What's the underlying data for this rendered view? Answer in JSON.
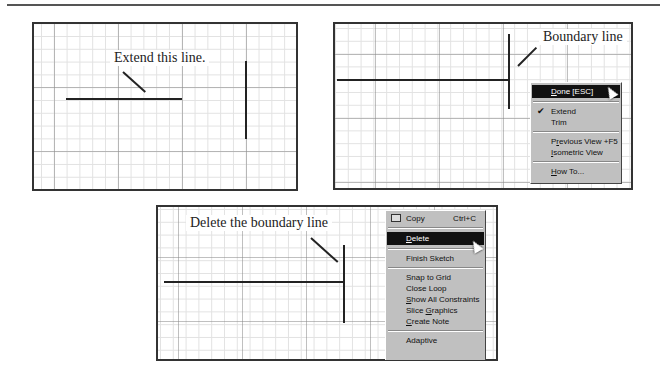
{
  "figures": [
    {
      "id": "extend-step",
      "callout": "Extend this line."
    },
    {
      "id": "boundary-step",
      "callout": "Boundary line",
      "context_menu": {
        "items": [
          {
            "label": "Done [ESC]",
            "mnemonic": "D",
            "highlighted": true
          },
          {
            "type": "separator"
          },
          {
            "label": "Extend",
            "checked": true
          },
          {
            "label": "Trim"
          },
          {
            "type": "separator"
          },
          {
            "label": "Previous View",
            "mnemonic": "r",
            "shortcut": "+F5"
          },
          {
            "label": "Isometric View",
            "mnemonic": "I"
          },
          {
            "type": "separator"
          },
          {
            "label": "How To...",
            "mnemonic": "H"
          }
        ]
      }
    },
    {
      "id": "delete-step",
      "callout": "Delete the boundary line",
      "context_menu": {
        "items": [
          {
            "label": "Copy",
            "shortcut": "Ctrl+C",
            "icon": "copy-icon"
          },
          {
            "type": "separator"
          },
          {
            "label": "Delete",
            "mnemonic": "D",
            "highlighted": true
          },
          {
            "type": "separator"
          },
          {
            "label": "Finish Sketch"
          },
          {
            "type": "separator"
          },
          {
            "label": "Snap to Grid"
          },
          {
            "label": "Close Loop"
          },
          {
            "label": "Show All Constraints",
            "mnemonic": "S"
          },
          {
            "label": "Slice Graphics",
            "mnemonic": "G"
          },
          {
            "label": "Create Note",
            "mnemonic": "C"
          },
          {
            "type": "separator"
          },
          {
            "label": "Adaptive"
          }
        ]
      }
    }
  ],
  "m1": {
    "done": "one [ESC]",
    "done_m": "D",
    "extend": "Extend",
    "trim": "Trim",
    "prev_a": "P",
    "prev_m": "r",
    "prev_b": "evious View",
    "prev_sc": "+F5",
    "iso_m": "I",
    "iso": "sometric View",
    "howto_m": "H",
    "howto": "ow To..."
  },
  "m2": {
    "copy": "Copy",
    "copy_sc": "Ctrl+C",
    "del_m": "D",
    "del": "elete",
    "finish": "Finish Sketch",
    "snap": "Snap to Grid",
    "close": "Close Loop",
    "show_m": "S",
    "show": "how All Constraints",
    "slice_a": "Slice ",
    "slice_m": "G",
    "slice_b": "raphics",
    "note_m": "C",
    "note": "reate Note",
    "adaptive": "Adaptive"
  }
}
